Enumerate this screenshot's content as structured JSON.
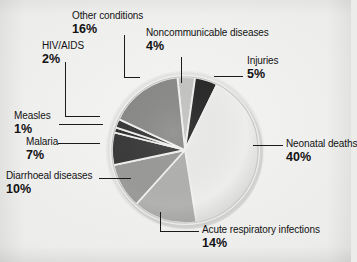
{
  "chart_data": {
    "type": "pie",
    "title": "",
    "subtitle": "",
    "xlabel": "",
    "ylabel": "",
    "legend_position": "callout-labels",
    "grid": false,
    "unit": "%",
    "total": 99,
    "categories": [
      "Noncommunicable diseases",
      "Injuries",
      "Neonatal deaths",
      "Acute respiratory infections",
      "Diarrhoeal diseases",
      "Malaria",
      "Measles",
      "HIV/AIDS",
      "Other conditions"
    ],
    "values": [
      4,
      5,
      40,
      14,
      10,
      7,
      1,
      2,
      16
    ],
    "slices": [
      {
        "label": "Noncommunicable diseases",
        "value": 4,
        "pct_text": "4%",
        "color": "#c6c6c4",
        "start_angle": 354,
        "end_angle": 368
      },
      {
        "label": "Injuries",
        "value": 5,
        "pct_text": "5%",
        "color": "#2b2b2b",
        "start_angle": 368,
        "end_angle": 386
      },
      {
        "label": "Neonatal deaths",
        "value": 40,
        "pct_text": "40%",
        "color": "#ededeb",
        "start_angle": 386,
        "end_angle": 531
      },
      {
        "label": "Acute respiratory infections",
        "value": 14,
        "pct_text": "14%",
        "color": "#b2b2b0",
        "start_angle": 531,
        "end_angle": 582
      },
      {
        "label": "Diarrhoeal diseases",
        "value": 10,
        "pct_text": "10%",
        "color": "#9b9b99",
        "start_angle": 582,
        "end_angle": 618
      },
      {
        "label": "Malaria",
        "value": 7,
        "pct_text": "7%",
        "color": "#3b3b3b",
        "start_angle": 618,
        "end_angle": 644
      },
      {
        "label": "Measles",
        "value": 1,
        "pct_text": "1%",
        "color": "#333333",
        "start_angle": 644,
        "end_angle": 648
      },
      {
        "label": "HIV/AIDS",
        "value": 2,
        "pct_text": "2%",
        "color": "#3a3a3a",
        "start_angle": 648,
        "end_angle": 655
      },
      {
        "label": "Other conditions",
        "value": 16,
        "pct_text": "16%",
        "color": "#8b8b89",
        "start_angle": 655,
        "end_angle": 714
      }
    ]
  },
  "labels": {
    "other_conditions": {
      "name": "Other conditions",
      "pct": "16%"
    },
    "noncommunicable": {
      "name": "Noncommunicable diseases",
      "pct": "4%"
    },
    "hiv_aids": {
      "name": "HIV/AIDS",
      "pct": "2%"
    },
    "injuries": {
      "name": "Injuries",
      "pct": "5%"
    },
    "measles": {
      "name": "Measles",
      "pct": "1%"
    },
    "malaria": {
      "name": "Malaria",
      "pct": "7%"
    },
    "diarrhoeal": {
      "name": "Diarrhoeal diseases",
      "pct": "10%"
    },
    "neonatal": {
      "name": "Neonatal deaths",
      "pct": "40%"
    },
    "acute_respiratory": {
      "name": "Acute respiratory infections",
      "pct": "14%"
    }
  },
  "style": {
    "background": "#ececeb",
    "text_color": "#121212",
    "leader_color": "#1a1a1a"
  }
}
